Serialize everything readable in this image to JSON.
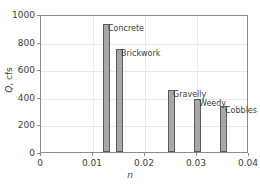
{
  "chart_data": {
    "type": "bar",
    "title": "",
    "subtitle": "",
    "xlabel": "n",
    "ylabel_symbol": "Q",
    "ylabel_units": ", cfs",
    "ylabel": "Q, cfs",
    "xlim": [
      0,
      0.04
    ],
    "ylim": [
      0,
      1000
    ],
    "grid": true,
    "legend": "none",
    "xticks": [
      "0",
      "0.01",
      "0.02",
      "0.03",
      "0.04"
    ],
    "xtick_values": [
      0,
      0.01,
      0.02,
      0.03,
      0.04
    ],
    "yticks": [
      "0",
      "200",
      "400",
      "600",
      "800",
      "1000"
    ],
    "ytick_values": [
      0,
      200,
      400,
      600,
      800,
      1000
    ],
    "bar_color": "#a8a8a8",
    "bar_edge_color": "#5a5a5a",
    "categories": [
      "Concrete",
      "Brickwork",
      "Gravelly",
      "Weedy",
      "Cobbles"
    ],
    "x": [
      0.0125,
      0.015,
      0.025,
      0.03,
      0.035
    ],
    "values": [
      930,
      750,
      450,
      385,
      330
    ],
    "points": [
      {
        "label": "Concrete",
        "n": 0.0125,
        "Q": 930
      },
      {
        "label": "Brickwork",
        "n": 0.015,
        "Q": 750
      },
      {
        "label": "Gravelly",
        "n": 0.025,
        "Q": 450
      },
      {
        "label": "Weedy",
        "n": 0.03,
        "Q": 385
      },
      {
        "label": "Cobbles",
        "n": 0.035,
        "Q": 330
      }
    ]
  }
}
